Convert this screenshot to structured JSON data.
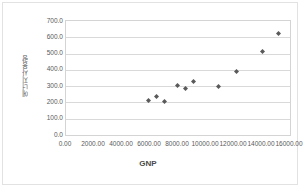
{
  "chart_data": {
    "type": "scatter",
    "title": "",
    "xlabel": "GNP",
    "ylabel": "에너지사용량",
    "xlim": [
      0,
      16000
    ],
    "ylim": [
      0,
      700
    ],
    "grid": true,
    "legend": false,
    "marker": "diamond",
    "marker_color": "#595959",
    "xticks": [
      "0.00",
      "2000.00",
      "4000.00",
      "6000.00",
      "8000.00",
      "10000.00",
      "12000.00",
      "14000.00",
      "16000.00"
    ],
    "xtick_values": [
      0,
      2000,
      4000,
      6000,
      8000,
      10000,
      12000,
      14000,
      16000
    ],
    "yticks": [
      "0.0",
      "100.0",
      "200.0",
      "300.0",
      "400.0",
      "500.0",
      "600.0",
      "700.0"
    ],
    "ytick_values": [
      0,
      100,
      200,
      300,
      400,
      500,
      600,
      700
    ],
    "points": [
      {
        "x": 5900,
        "y": 210
      },
      {
        "x": 6450,
        "y": 237
      },
      {
        "x": 7050,
        "y": 205
      },
      {
        "x": 7950,
        "y": 305
      },
      {
        "x": 8550,
        "y": 283
      },
      {
        "x": 9100,
        "y": 330
      },
      {
        "x": 10900,
        "y": 298
      },
      {
        "x": 12150,
        "y": 388
      },
      {
        "x": 14050,
        "y": 510
      },
      {
        "x": 15150,
        "y": 625
      }
    ]
  }
}
